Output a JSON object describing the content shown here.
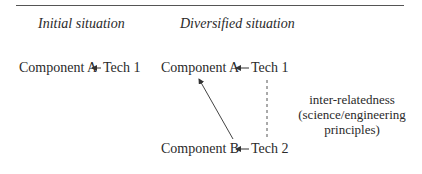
{
  "headers": {
    "initial": "Initial situation",
    "diversified": "Diversified situation"
  },
  "initial": {
    "component": "Component A",
    "tech": "Tech 1"
  },
  "diversified": {
    "row_a": {
      "component": "Component A",
      "tech": "Tech 1"
    },
    "row_b": {
      "component": "Component B",
      "tech": "Tech 2"
    }
  },
  "note": {
    "line1": "inter-relatedness",
    "line2": "(science/engineering",
    "line3": "principles)"
  },
  "edges": [
    {
      "from": "Tech 1",
      "to": "Component A",
      "style": "solid-arrow",
      "situation": "initial"
    },
    {
      "from": "Tech 1",
      "to": "Component A",
      "style": "solid-arrow",
      "situation": "diversified"
    },
    {
      "from": "Tech 2",
      "to": "Component B",
      "style": "solid-arrow",
      "situation": "diversified"
    },
    {
      "from": "Tech 2",
      "to": "Component A",
      "style": "solid-arrow-diagonal",
      "situation": "diversified"
    },
    {
      "from": "Tech 1",
      "to": "Tech 2",
      "style": "dashed",
      "label": "inter-relatedness"
    }
  ]
}
